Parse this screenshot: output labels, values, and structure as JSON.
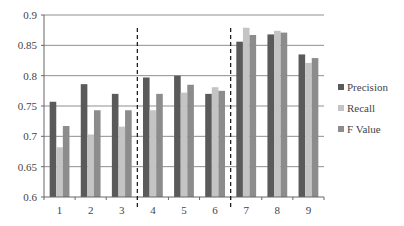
{
  "chart_data": {
    "type": "bar",
    "title": "",
    "xlabel": "",
    "ylabel": "",
    "ylim": [
      0.6,
      0.9
    ],
    "yticks": [
      "0.6",
      "0.65",
      "0.7",
      "0.75",
      "0.8",
      "0.85",
      "0.9"
    ],
    "grid": true,
    "legend_position": "right",
    "categories": [
      "1",
      "2",
      "3",
      "4",
      "5",
      "6",
      "7",
      "8",
      "9"
    ],
    "series": [
      {
        "name": "Precision",
        "color": "#5a5a5a",
        "values": [
          0.757,
          0.786,
          0.77,
          0.797,
          0.8,
          0.77,
          0.856,
          0.868,
          0.835
        ]
      },
      {
        "name": "Recall",
        "color": "#c4c4c4",
        "values": [
          0.682,
          0.703,
          0.716,
          0.743,
          0.772,
          0.781,
          0.879,
          0.874,
          0.821
        ]
      },
      {
        "name": "F Value",
        "color": "#8c8c8c",
        "values": [
          0.717,
          0.743,
          0.743,
          0.77,
          0.785,
          0.775,
          0.867,
          0.871,
          0.829
        ]
      }
    ],
    "annotations": [
      {
        "type": "dashed-vertical-line",
        "between": [
          "3",
          "4"
        ]
      },
      {
        "type": "dashed-vertical-line",
        "between": [
          "6",
          "7"
        ]
      }
    ]
  }
}
